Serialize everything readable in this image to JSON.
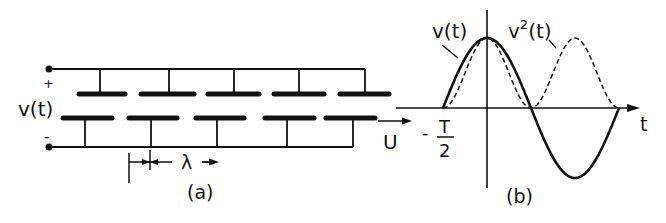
{
  "figure_a": {
    "caption": "(a)",
    "voltage_label": "v(t)",
    "plus_sign": "+",
    "minus_sign": "-",
    "wavelength_label": "λ",
    "velocity_label": "U",
    "top_electrode_count": 5,
    "bottom_electrode_count": 5
  },
  "figure_b": {
    "caption": "(b)",
    "curve_v_label": "v(t)",
    "curve_v2_label_base": "v",
    "curve_v2_label_sup": "2",
    "curve_v2_label_tail": "(t)",
    "time_axis_label": "t",
    "half_period_sign": "-",
    "half_period_num": "T",
    "half_period_den": "2",
    "colors": {
      "ink": "#111111"
    }
  }
}
